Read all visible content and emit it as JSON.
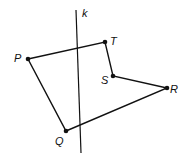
{
  "diagram": {
    "type": "geometry-figure",
    "line": {
      "label": "k",
      "x1": 76,
      "y1": 10,
      "x2": 81,
      "y2": 153,
      "label_x": 82,
      "label_y": 17
    },
    "points": [
      {
        "name": "P",
        "x": 28,
        "y": 59,
        "label_x": 14,
        "label_y": 62
      },
      {
        "name": "T",
        "x": 105,
        "y": 42,
        "label_x": 110,
        "label_y": 45
      },
      {
        "name": "S",
        "x": 113,
        "y": 76,
        "label_x": 101,
        "label_y": 84
      },
      {
        "name": "R",
        "x": 167,
        "y": 88,
        "label_x": 170,
        "label_y": 93
      },
      {
        "name": "Q",
        "x": 66,
        "y": 131,
        "label_x": 55,
        "label_y": 145
      }
    ],
    "polygon_order": [
      "P",
      "T",
      "S",
      "R",
      "Q"
    ],
    "stroke_color": "#111111"
  }
}
